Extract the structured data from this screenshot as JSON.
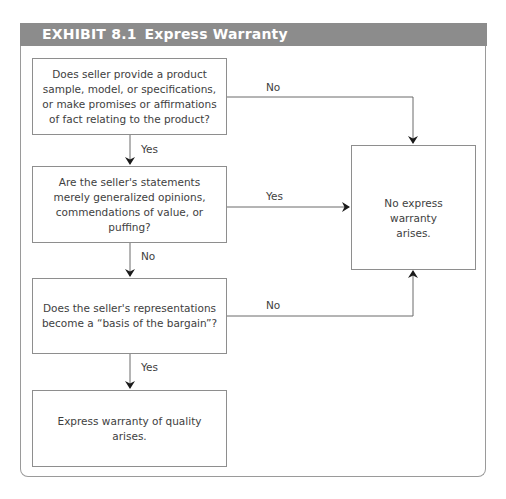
{
  "exhibit": {
    "number": "EXHIBIT 8.1",
    "title": "Express Warranty",
    "header_color": "#8c8c8c",
    "header_text_color": "#ffffff"
  },
  "nodes": [
    {
      "id": "q1",
      "text": "Does seller provide a product sample, model, or specifications, or make promises or affirmations of fact relating to the product?"
    },
    {
      "id": "q2",
      "text": "Are the seller's statements merely generalized opinions, commendations of value, or puffing?"
    },
    {
      "id": "q3",
      "text": "Does the seller's representations become a “basis of the bargain”?"
    },
    {
      "id": "r1",
      "text": "Express warranty of quality arises."
    },
    {
      "id": "r2",
      "text": "No express warranty arises."
    }
  ],
  "edges": [
    {
      "from": "q1",
      "to": "r2",
      "label": "No"
    },
    {
      "from": "q1",
      "to": "q2",
      "label": "Yes"
    },
    {
      "from": "q2",
      "to": "r2",
      "label": "Yes"
    },
    {
      "from": "q2",
      "to": "q3",
      "label": "No"
    },
    {
      "from": "q3",
      "to": "r2",
      "label": "No"
    },
    {
      "from": "q3",
      "to": "r1",
      "label": "Yes"
    }
  ]
}
